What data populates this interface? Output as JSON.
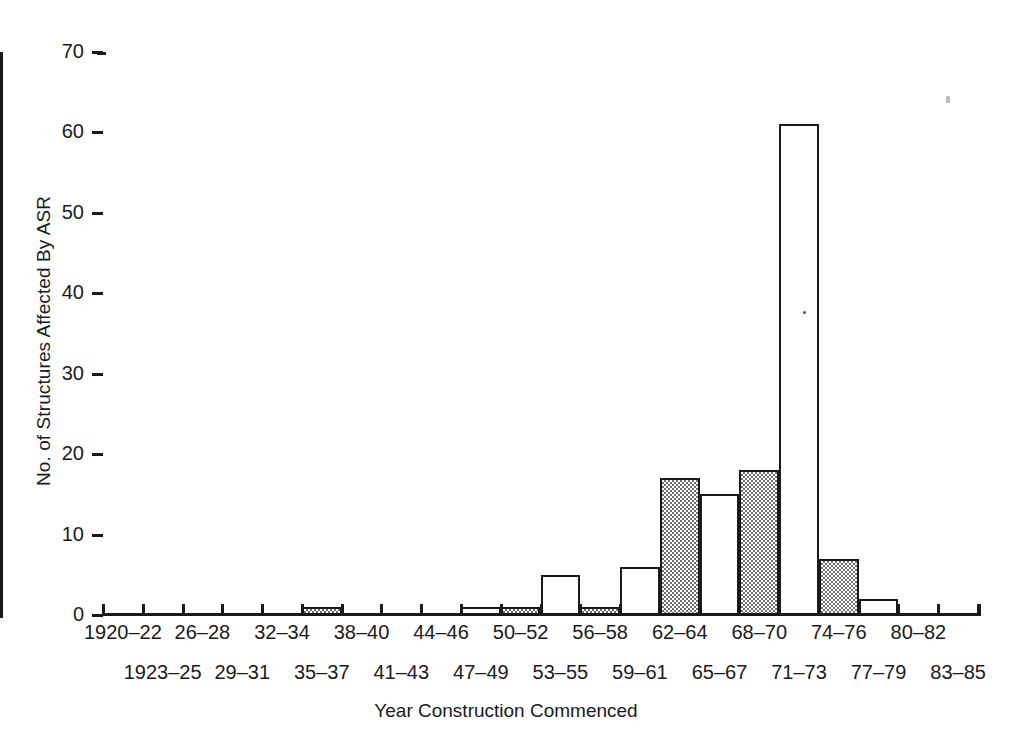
{
  "chart_data": {
    "type": "bar",
    "title": "",
    "xlabel": "Year Construction Commenced",
    "ylabel": "No. of Structures Affected By ASR",
    "ylim": [
      0,
      70
    ],
    "yticks": [
      0,
      10,
      20,
      30,
      40,
      50,
      60,
      70
    ],
    "grid": false,
    "legend": "none",
    "categories": [
      "1920–22",
      "1923–25",
      "26–28",
      "29–31",
      "32–34",
      "35–37",
      "38–40",
      "41–43",
      "44–46",
      "47–49",
      "50–52",
      "53–55",
      "56–58",
      "59–61",
      "62–64",
      "65–67",
      "68–70",
      "71–73",
      "74–76",
      "77–79",
      "80–82",
      "83–85"
    ],
    "values": [
      0,
      0,
      0,
      0,
      0,
      1,
      0,
      0,
      0,
      1,
      1,
      5,
      1,
      6,
      17,
      15,
      18,
      61,
      7,
      2,
      0,
      0
    ],
    "bar_styles": [
      "open",
      "shaded",
      "open",
      "shaded",
      "open",
      "shaded",
      "open",
      "shaded",
      "open",
      "open",
      "shaded",
      "open",
      "shaded",
      "open",
      "shaded",
      "open",
      "shaded",
      "open",
      "shaded",
      "open",
      "shaded",
      "open"
    ],
    "colors": {
      "axis": "#1a1a1a",
      "bar_outline": "#1a1a1a",
      "bar_open_fill": "#ffffff",
      "bar_shaded_fill": "#6f6f6f",
      "background": "#ffffff"
    }
  },
  "axis": {
    "y_tick_labels": [
      "0",
      "10",
      "20",
      "30",
      "40",
      "50",
      "60",
      "70"
    ],
    "y_title": "No. of Structures Affected By ASR",
    "x_title": "Year Construction Commenced",
    "x_tick_labels_top": [
      "1920–22",
      "26–28",
      "32–34",
      "38–40",
      "44–46",
      "50–52",
      "56–58",
      "62–64",
      "68–70",
      "74–76",
      "80–82"
    ],
    "x_tick_labels_bottom": [
      "1923–25",
      "29–31",
      "35–37",
      "41–43",
      "47–49",
      "53–55",
      "59–61",
      "65–67",
      "71–73",
      "77–79",
      "83–85"
    ]
  }
}
